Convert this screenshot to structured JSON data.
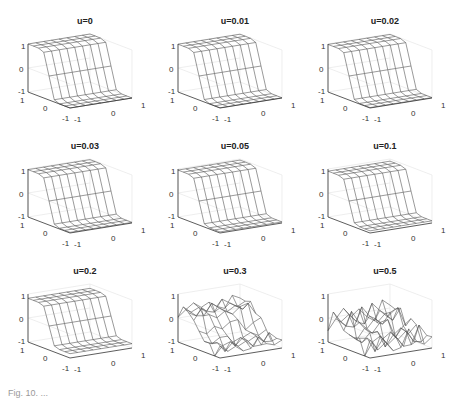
{
  "chart_data": [
    {
      "type": "surface",
      "title": "u=0",
      "zlim": [
        -1,
        1
      ],
      "xlim": [
        -1,
        1
      ],
      "ylim": [
        -1,
        1
      ],
      "zticks": [
        "1",
        "0",
        "-1"
      ],
      "yticks": [
        "1",
        "0",
        "-1"
      ],
      "xticks": [
        "-1",
        "0",
        "1"
      ],
      "surface": "smooth step: high plateau (z=1) at back, low (z=-1) at front"
    },
    {
      "type": "surface",
      "title": "u=0.01",
      "zlim": [
        -1,
        1
      ],
      "xlim": [
        -1,
        1
      ],
      "ylim": [
        -1,
        1
      ],
      "zticks": [
        "1",
        "0",
        "-1"
      ],
      "yticks": [
        "1",
        "0",
        "-1"
      ],
      "xticks": [
        "-1",
        "0",
        "1"
      ],
      "surface": "smooth step"
    },
    {
      "type": "surface",
      "title": "u=0.02",
      "zlim": [
        -1,
        1
      ],
      "xlim": [
        -1,
        1
      ],
      "ylim": [
        -1,
        1
      ],
      "zticks": [
        "1",
        "0",
        "-1"
      ],
      "yticks": [
        "1",
        "0",
        "-1"
      ],
      "xticks": [
        "-1",
        "0",
        "1"
      ],
      "surface": "smooth step"
    },
    {
      "type": "surface",
      "title": "u=0.03",
      "zlim": [
        -1,
        1
      ],
      "xlim": [
        -1,
        1
      ],
      "ylim": [
        -1,
        1
      ],
      "zticks": [
        "1",
        "0",
        "-1"
      ],
      "yticks": [
        "1",
        "0",
        "-1"
      ],
      "xticks": [
        "-1",
        "0",
        "1"
      ],
      "surface": "smooth step"
    },
    {
      "type": "surface",
      "title": "u=0.05",
      "zlim": [
        -1,
        1
      ],
      "xlim": [
        -1,
        1
      ],
      "ylim": [
        -1,
        1
      ],
      "zticks": [
        "1",
        "0",
        "-1"
      ],
      "yticks": [
        "1",
        "0",
        "-1"
      ],
      "xticks": [
        "-1",
        "0",
        "1"
      ],
      "surface": "smooth step"
    },
    {
      "type": "surface",
      "title": "u=0.1",
      "zlim": [
        -1,
        1
      ],
      "xlim": [
        -1,
        1
      ],
      "ylim": [
        -1,
        1
      ],
      "zticks": [
        "1",
        "0",
        "-1"
      ],
      "yticks": [
        "1",
        "0",
        "-1"
      ],
      "xticks": [
        "-1",
        "0",
        "1"
      ],
      "surface": "smooth step, slight flattening"
    },
    {
      "type": "surface",
      "title": "u=0.2",
      "zlim": [
        -1,
        1
      ],
      "xlim": [
        -1,
        1
      ],
      "ylim": [
        -1,
        1
      ],
      "zticks": [
        "1",
        "0",
        "-1"
      ],
      "yticks": [
        "1",
        "0",
        "-1"
      ],
      "xticks": [
        "-1",
        "0",
        "1"
      ],
      "surface": "step with reduced amplitude"
    },
    {
      "type": "surface",
      "title": "u=0.3",
      "zlim": [
        -1,
        1
      ],
      "xlim": [
        -1,
        1
      ],
      "ylim": [
        -1,
        1
      ],
      "zticks": [
        "1",
        "0",
        "-1"
      ],
      "yticks": [
        "1",
        "0",
        "-1"
      ],
      "xticks": [
        "-1",
        "0",
        "1"
      ],
      "surface": "distorted, partially broken step"
    },
    {
      "type": "surface",
      "title": "u=0.5",
      "zlim": [
        -1,
        1
      ],
      "xlim": [
        -1,
        1
      ],
      "ylim": [
        -1,
        1
      ],
      "zticks": [
        "1",
        "0",
        "-1"
      ],
      "yticks": [
        "1",
        "0",
        "-1"
      ],
      "xticks": [
        "-1",
        "0",
        "1"
      ],
      "surface": "fragmented surface, mostly near z=-1 with isolated pieces"
    }
  ],
  "caption": "Fig. 10. ..."
}
